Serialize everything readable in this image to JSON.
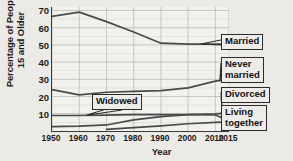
{
  "chart_data": {
    "type": "line",
    "title": "",
    "xlabel": "Year",
    "ylabel": "Percentage of People 15 and Older",
    "x": [
      1950,
      1960,
      1970,
      1980,
      1990,
      2000,
      2010,
      2015
    ],
    "xlim": [
      1950,
      2015
    ],
    "ylim": [
      0,
      72
    ],
    "yticks": [
      10,
      20,
      30,
      40,
      50,
      60,
      70
    ],
    "xticks": [
      "1950",
      "1960",
      "1970",
      "1980",
      "1990",
      "2000",
      "2010",
      "2015"
    ],
    "grid": true,
    "legend_position": "inline-callouts",
    "series": [
      {
        "name": "Married",
        "values": [
          66.5,
          69.0,
          63.5,
          57.5,
          51.0,
          50.5,
          50.5,
          50.5
        ]
      },
      {
        "name": "Never married",
        "values": [
          24.0,
          21.0,
          22.5,
          23.0,
          23.5,
          25.0,
          29.0,
          30.0
        ]
      },
      {
        "name": "Widowed",
        "values": [
          9.0,
          9.0,
          9.2,
          9.5,
          9.5,
          9.5,
          9.3,
          6.0
        ]
      },
      {
        "name": "Divorced",
        "values": [
          2.5,
          2.8,
          3.5,
          6.5,
          8.3,
          9.5,
          10.0,
          10.5
        ]
      },
      {
        "name": "Living together",
        "values": [
          null,
          null,
          1.0,
          2.0,
          3.0,
          4.2,
          5.0,
          5.3
        ]
      }
    ]
  },
  "labels": {
    "y_axis_title": "Percentage of People\n15 and Older",
    "x_axis_title": "Year",
    "married": "Married",
    "never_married": "Never\nmarried",
    "divorced": "Divorced",
    "living_together": "Living\ntogether",
    "widowed": "Widowed"
  },
  "colors": {
    "plot_background": "#f3f1ee",
    "page_background": "#eceae6",
    "axis": "#3a3a3a",
    "grid": "#b9b7b3",
    "line": "#4a4a4a",
    "callout_border": "#2b2b2b",
    "text": "#111111"
  }
}
